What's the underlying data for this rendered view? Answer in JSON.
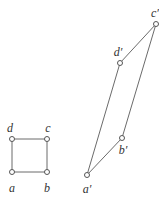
{
  "diagram": {
    "colors": {
      "line": "#6b6b6b",
      "vertex_stroke": "#555555",
      "vertex_fill": "#ffffff",
      "label": "#333333"
    },
    "square": {
      "vertices": [
        {
          "id": "a",
          "label": "a",
          "x": 12,
          "y": 172,
          "lx": 12,
          "ly": 192
        },
        {
          "id": "b",
          "label": "b",
          "x": 47,
          "y": 172,
          "lx": 47,
          "ly": 192
        },
        {
          "id": "c",
          "label": "c",
          "x": 47,
          "y": 139,
          "lx": 48,
          "ly": 132
        },
        {
          "id": "d",
          "label": "d",
          "x": 12,
          "y": 139,
          "lx": 10,
          "ly": 132
        }
      ]
    },
    "parallelogram": {
      "vertices": [
        {
          "id": "a-prime",
          "label": "a′",
          "x": 87,
          "y": 175,
          "lx": 87,
          "ly": 193
        },
        {
          "id": "b-prime",
          "label": "b′",
          "x": 122,
          "y": 138,
          "lx": 123,
          "ly": 154
        },
        {
          "id": "c-prime",
          "label": "c′",
          "x": 156,
          "y": 24,
          "lx": 155,
          "ly": 17
        },
        {
          "id": "d-prime",
          "label": "d′",
          "x": 120,
          "y": 63,
          "lx": 118,
          "ly": 56
        }
      ]
    }
  }
}
